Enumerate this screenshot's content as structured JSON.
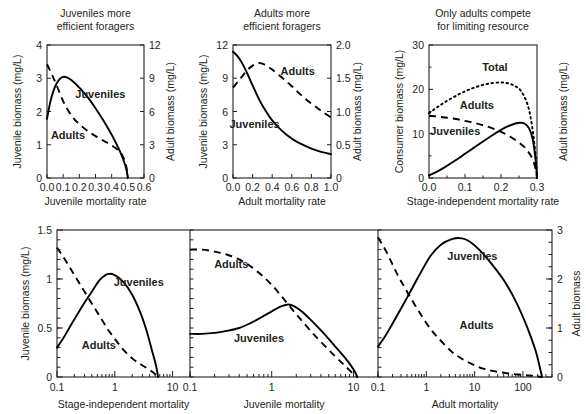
{
  "figure": {
    "width": 586,
    "height": 414,
    "background": "#ffffff",
    "ink": "#231f20"
  },
  "chart_data": [
    {
      "id": "panel-juveniles-efficient",
      "type": "line",
      "title": "Juveniles more\nefficient foragers",
      "title_line1": "Juveniles more",
      "title_line2": "efficient foragers",
      "xlabel": "Juvenile mortality rate",
      "ylabel": "Juvenile biomass (mg/L)",
      "ylabel_right": "Adult biomass (mg/L)",
      "xlim": [
        0.0,
        0.6
      ],
      "ylim": [
        0,
        4
      ],
      "ylim_right": [
        0,
        12
      ],
      "xscale": "linear",
      "xticks": [
        0.0,
        0.1,
        0.2,
        0.3,
        0.4,
        0.5,
        0.6
      ],
      "xticklabels": [
        "0.0",
        "0.1",
        "0.2",
        "0.3",
        "0.4",
        "0.5",
        "0.6"
      ],
      "yticks": [
        0,
        1,
        2,
        3,
        4
      ],
      "yticklabels": [
        "0",
        "1",
        "2",
        "3",
        "4"
      ],
      "yticks_right": [
        0,
        3,
        6,
        9,
        12
      ],
      "yticklabels_right": [
        "0",
        "3",
        "6",
        "9",
        "12"
      ],
      "grid": false,
      "legend": "inline annotations",
      "series": [
        {
          "name": "Juveniles",
          "style": "solid",
          "axis": "left",
          "annotation": "Juveniles",
          "x": [
            0.0,
            0.02,
            0.04,
            0.06,
            0.08,
            0.1,
            0.12,
            0.15,
            0.2,
            0.25,
            0.3,
            0.35,
            0.4,
            0.44,
            0.47,
            0.49,
            0.5
          ],
          "y": [
            1.78,
            2.28,
            2.62,
            2.85,
            2.98,
            3.04,
            3.03,
            2.95,
            2.72,
            2.44,
            2.1,
            1.72,
            1.3,
            0.92,
            0.58,
            0.28,
            0.0
          ]
        },
        {
          "name": "Adults",
          "style": "dashed",
          "axis": "right",
          "annotation": "Adults",
          "x": [
            0.0,
            0.03,
            0.06,
            0.09,
            0.12,
            0.16,
            0.2,
            0.25,
            0.3,
            0.35,
            0.4,
            0.44,
            0.47,
            0.49,
            0.5
          ],
          "y_left_equiv": [
            3.42,
            3.12,
            2.78,
            2.42,
            2.12,
            1.82,
            1.62,
            1.42,
            1.26,
            1.12,
            0.98,
            0.84,
            0.64,
            0.36,
            0.0
          ],
          "y": [
            10.26,
            9.36,
            8.34,
            7.26,
            6.36,
            5.46,
            4.86,
            4.26,
            3.78,
            3.36,
            2.94,
            2.52,
            1.92,
            1.08,
            0.0
          ]
        }
      ],
      "annotations": [
        {
          "text": "Juveniles",
          "x": 0.33,
          "y": 2.42
        },
        {
          "text": "Adults",
          "x": 0.13,
          "y": 1.18
        }
      ]
    },
    {
      "id": "panel-adults-efficient",
      "type": "line",
      "title": "Adults more\nefficient foragers",
      "title_line1": "Adults more",
      "title_line2": "efficient foragers",
      "xlabel": "Adult mortality rate",
      "ylabel": "Juvenile biomass (mg/L)",
      "ylabel_right": "Adult biomass (mg/L)",
      "xlim": [
        0.0,
        1.0
      ],
      "ylim": [
        0,
        12
      ],
      "ylim_right": [
        0,
        2.0
      ],
      "xscale": "linear",
      "xticks": [
        0.0,
        0.2,
        0.4,
        0.6,
        0.8,
        1.0
      ],
      "xticklabels": [
        "0.0",
        "0.2",
        "0.4",
        "0.6",
        "0.8",
        "1.0"
      ],
      "yticks": [
        0,
        3,
        6,
        9,
        12
      ],
      "yticklabels": [
        "0",
        "3",
        "6",
        "9",
        "12"
      ],
      "yticks_right": [
        0,
        0.5,
        1.0,
        1.5,
        2.0
      ],
      "yticklabels_right": [
        "0",
        "0.5",
        "1.0",
        "1.5",
        "2.0"
      ],
      "grid": false,
      "series": [
        {
          "name": "Juveniles",
          "style": "solid",
          "axis": "left",
          "annotation": "Juveniles",
          "x": [
            0.0,
            0.05,
            0.1,
            0.15,
            0.2,
            0.25,
            0.3,
            0.4,
            0.5,
            0.6,
            0.7,
            0.8,
            0.9,
            1.0
          ],
          "y": [
            11.4,
            10.95,
            10.25,
            9.35,
            8.35,
            7.4,
            6.55,
            5.2,
            4.25,
            3.55,
            3.05,
            2.65,
            2.35,
            2.15
          ]
        },
        {
          "name": "Adults",
          "style": "dashed",
          "axis": "right",
          "annotation": "Adults",
          "x": [
            0.0,
            0.05,
            0.1,
            0.15,
            0.2,
            0.25,
            0.3,
            0.35,
            0.4,
            0.5,
            0.6,
            0.7,
            0.8,
            0.9,
            1.0
          ],
          "y_left_equiv": [
            8.15,
            8.7,
            9.25,
            9.75,
            10.15,
            10.35,
            10.3,
            10.1,
            9.8,
            9.05,
            8.25,
            7.45,
            6.7,
            6.05,
            5.45
          ],
          "y": [
            1.36,
            1.45,
            1.54,
            1.63,
            1.69,
            1.73,
            1.72,
            1.68,
            1.63,
            1.51,
            1.38,
            1.24,
            1.12,
            1.01,
            0.91
          ]
        }
      ],
      "annotations": [
        {
          "text": "Adults",
          "x": 0.66,
          "y": 9.25
        },
        {
          "text": "Juveniles",
          "x": 0.22,
          "y": 4.55
        }
      ]
    },
    {
      "id": "panel-only-adults-compete",
      "type": "line",
      "title": "Only adults compete\nfor limiting resource",
      "title_line1": "Only adults compete",
      "title_line2": "for limiting resource",
      "xlabel": "Stage-independent mortality rate",
      "ylabel": "Consumer biomass (mg/L)",
      "ylabel_right": "Adult biomass (mg/L)",
      "xlim": [
        0.0,
        0.3
      ],
      "ylim": [
        0,
        30
      ],
      "xscale": "linear",
      "xticks": [
        0.0,
        0.1,
        0.2,
        0.3
      ],
      "xticklabels": [
        "0.0",
        "0.1",
        "0.2",
        "0.3"
      ],
      "minor_xticks": [
        0.05,
        0.15,
        0.25
      ],
      "yticks": [
        0,
        10,
        20,
        30
      ],
      "yticklabels": [
        "0",
        "10",
        "20",
        "30"
      ],
      "minor_yticks": [
        5,
        15,
        25
      ],
      "grid": false,
      "series": [
        {
          "name": "Total",
          "style": "dotted",
          "axis": "left",
          "annotation": "Total",
          "x": [
            0.0,
            0.025,
            0.05,
            0.075,
            0.1,
            0.125,
            0.15,
            0.175,
            0.2,
            0.22,
            0.24,
            0.255,
            0.27,
            0.28,
            0.29,
            0.297,
            0.3
          ],
          "y": [
            14.6,
            16.1,
            17.4,
            18.55,
            19.55,
            20.35,
            21.0,
            21.4,
            21.55,
            21.35,
            20.7,
            19.7,
            17.4,
            14.6,
            9.6,
            4.2,
            0.0
          ]
        },
        {
          "name": "Adults",
          "style": "dashed",
          "axis": "left",
          "annotation": "Adults",
          "x": [
            0.0,
            0.025,
            0.05,
            0.075,
            0.1,
            0.125,
            0.15,
            0.175,
            0.2,
            0.225,
            0.25,
            0.265,
            0.28,
            0.29,
            0.297,
            0.3
          ],
          "y": [
            14.05,
            13.85,
            13.6,
            13.3,
            12.9,
            12.45,
            11.9,
            11.25,
            10.4,
            9.35,
            8.0,
            6.95,
            5.4,
            3.8,
            1.7,
            0.0
          ]
        },
        {
          "name": "Juveniles",
          "style": "solid",
          "axis": "left",
          "annotation": "Juveniles",
          "x": [
            0.0,
            0.025,
            0.05,
            0.075,
            0.1,
            0.125,
            0.15,
            0.175,
            0.2,
            0.22,
            0.24,
            0.252,
            0.265,
            0.278,
            0.288,
            0.296,
            0.3
          ],
          "y": [
            0.6,
            1.55,
            2.75,
            4.05,
            5.45,
            6.85,
            8.25,
            9.6,
            10.85,
            11.7,
            12.3,
            12.45,
            12.3,
            11.2,
            8.8,
            4.2,
            0.0
          ]
        }
      ],
      "annotations": [
        {
          "text": "Total",
          "x": 0.183,
          "y": 24.2
        },
        {
          "text": "Adults",
          "x": 0.133,
          "y": 15.6
        },
        {
          "text": "Juveniles",
          "x": 0.073,
          "y": 9.7
        }
      ]
    },
    {
      "id": "panel-stage-independent-log",
      "type": "line",
      "xlabel": "Stage-independent mortality",
      "ylabel": "Juvenile biomass (mg/L)",
      "xlim": [
        0.1,
        20
      ],
      "ylim": [
        0,
        1.5
      ],
      "xscale": "log",
      "xticks": [
        0.1,
        1,
        10
      ],
      "xticklabels": [
        "0.1",
        "1",
        "10"
      ],
      "yticks": [
        0,
        0.5,
        1,
        1.5
      ],
      "yticklabels": [
        "0",
        "0.5",
        "1",
        "1.5"
      ],
      "grid": false,
      "series": [
        {
          "name": "Juveniles",
          "style": "solid",
          "axis": "left",
          "annotation": "Juveniles",
          "x": [
            0.1,
            0.13,
            0.17,
            0.22,
            0.3,
            0.4,
            0.55,
            0.75,
            1.0,
            1.4,
            2.0,
            2.8,
            3.6,
            4.4,
            5.0,
            5.4,
            5.6
          ],
          "y": [
            0.3,
            0.4,
            0.52,
            0.63,
            0.76,
            0.87,
            0.99,
            1.05,
            1.04,
            0.97,
            0.84,
            0.65,
            0.46,
            0.27,
            0.15,
            0.06,
            0.0
          ]
        },
        {
          "name": "Adults",
          "style": "dashed",
          "axis": "left",
          "annotation": "Adults",
          "x": [
            0.1,
            0.13,
            0.17,
            0.22,
            0.3,
            0.4,
            0.55,
            0.75,
            1.0,
            1.4,
            2.0,
            2.8,
            3.6,
            4.5,
            5.2,
            5.6
          ],
          "y": [
            1.32,
            1.22,
            1.11,
            1.0,
            0.87,
            0.75,
            0.62,
            0.49,
            0.39,
            0.28,
            0.19,
            0.13,
            0.09,
            0.05,
            0.02,
            0.0
          ]
        }
      ],
      "annotations": [
        {
          "text": "Juveniles",
          "x": 2.6,
          "y": 0.93
        },
        {
          "text": "Adults",
          "x": 0.53,
          "y": 0.29
        }
      ]
    },
    {
      "id": "panel-juvenile-mortality-log",
      "type": "line",
      "xlabel": "Juvenile mortality",
      "xlim": [
        0.1,
        20
      ],
      "ylim": [
        0,
        1.5
      ],
      "xscale": "log",
      "xticks": [
        0.1,
        1,
        10
      ],
      "xticklabels": [
        "0.1",
        "1",
        "10"
      ],
      "grid": false,
      "series": [
        {
          "name": "Adults",
          "style": "dashed",
          "axis": "left",
          "annotation": "Adults",
          "x": [
            0.1,
            0.14,
            0.2,
            0.28,
            0.4,
            0.55,
            0.75,
            1.0,
            1.3,
            1.7,
            2.2,
            3.0,
            4.2,
            6.0,
            8.0,
            10.0,
            11.2
          ],
          "y": [
            1.3,
            1.3,
            1.28,
            1.25,
            1.2,
            1.13,
            1.04,
            0.94,
            0.83,
            0.71,
            0.6,
            0.47,
            0.34,
            0.21,
            0.11,
            0.03,
            0.0
          ]
        },
        {
          "name": "Juveniles",
          "style": "solid",
          "axis": "left",
          "annotation": "Juveniles",
          "x": [
            0.1,
            0.14,
            0.2,
            0.28,
            0.4,
            0.55,
            0.75,
            1.0,
            1.3,
            1.6,
            1.9,
            2.4,
            3.2,
            4.4,
            6.0,
            8.0,
            10.0,
            11.2
          ],
          "y": [
            0.44,
            0.44,
            0.45,
            0.47,
            0.5,
            0.55,
            0.61,
            0.67,
            0.72,
            0.74,
            0.72,
            0.66,
            0.56,
            0.44,
            0.31,
            0.19,
            0.08,
            0.0
          ]
        }
      ],
      "annotations": [
        {
          "text": "Adults",
          "x": 0.32,
          "y": 1.11
        },
        {
          "text": "Juveniles",
          "x": 0.7,
          "y": 0.36
        }
      ]
    },
    {
      "id": "panel-adult-mortality-log",
      "type": "line",
      "xlabel": "Adult mortality",
      "ylabel_right": "Adult biomass",
      "xlim": [
        0.1,
        400
      ],
      "ylim": [
        0,
        3
      ],
      "xscale": "log",
      "xticks": [
        0.1,
        1,
        10,
        100
      ],
      "xticklabels": [
        "0.1",
        "1",
        "10",
        "100"
      ],
      "yticks_right": [
        0,
        1,
        2,
        3
      ],
      "yticklabels_right": [
        "0",
        "1",
        "2",
        "3"
      ],
      "grid": false,
      "series": [
        {
          "name": "Juveniles",
          "style": "solid",
          "axis": "right",
          "annotation": "Juveniles",
          "x": [
            0.1,
            0.15,
            0.25,
            0.4,
            0.7,
            1.2,
            2.0,
            3.5,
            5.5,
            8.0,
            13.0,
            22.0,
            40.0,
            70.0,
            120.0,
            180.0,
            230.0,
            250.0
          ],
          "y": [
            0.62,
            0.88,
            1.26,
            1.62,
            2.06,
            2.46,
            2.7,
            2.82,
            2.83,
            2.76,
            2.58,
            2.32,
            1.98,
            1.56,
            1.04,
            0.56,
            0.15,
            0.0
          ]
        },
        {
          "name": "Adults",
          "style": "dashed",
          "axis": "right",
          "annotation": "Adults",
          "x": [
            0.1,
            0.15,
            0.25,
            0.4,
            0.7,
            1.2,
            2.0,
            3.5,
            5.5,
            9.0,
            15.0,
            25.0,
            45.0,
            80.0,
            140.0,
            200.0,
            250.0
          ],
          "y": [
            2.85,
            2.55,
            2.1,
            1.74,
            1.34,
            0.99,
            0.74,
            0.5,
            0.37,
            0.26,
            0.17,
            0.12,
            0.08,
            0.05,
            0.03,
            0.01,
            0.0
          ]
        }
      ],
      "annotations": [
        {
          "text": "Juveniles",
          "x": 9.0,
          "y": 2.38
        },
        {
          "text": "Adults",
          "x": 11.0,
          "y": 0.97
        }
      ]
    }
  ]
}
